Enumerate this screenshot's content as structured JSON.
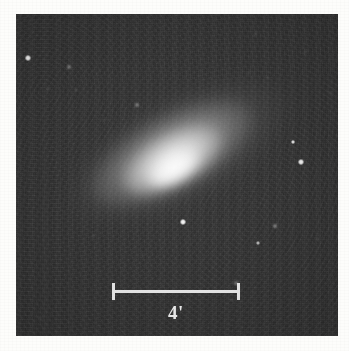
{
  "figure": {
    "type": "astronomical-photograph",
    "background_color": "#2b2b2b",
    "page_color": "#fdfdfb",
    "plate": {
      "x": 16,
      "y": 14,
      "width": 322,
      "height": 322
    }
  },
  "scalebar": {
    "label": "4'",
    "unit": "arcminutes",
    "value": 4,
    "color": "#e6e6e6",
    "x": 112,
    "y": 283,
    "length_px": 128
  },
  "galaxy": {
    "name": "galaxy",
    "center_x": 172,
    "center_y": 175,
    "position_angle_deg": -28,
    "major_axis_px": 150,
    "minor_axis_px": 65,
    "morphology": "lenticular / elliptical, smooth bright bulge with diffuse halo"
  },
  "chart_data": {
    "type": "scatter",
    "title": "",
    "xlabel": "",
    "ylabel": "",
    "stars": [
      {
        "x": 28,
        "y": 58,
        "r": 2.6,
        "brightness": 0.95
      },
      {
        "x": 69,
        "y": 67,
        "r": 1.5,
        "brightness": 0.5
      },
      {
        "x": 48,
        "y": 89,
        "r": 1.3,
        "brightness": 0.4
      },
      {
        "x": 76,
        "y": 90,
        "r": 1.3,
        "brightness": 0.42
      },
      {
        "x": 137,
        "y": 105,
        "r": 1.6,
        "brightness": 0.52
      },
      {
        "x": 104,
        "y": 120,
        "r": 1.2,
        "brightness": 0.34
      },
      {
        "x": 256,
        "y": 34,
        "r": 1.3,
        "brightness": 0.4
      },
      {
        "x": 305,
        "y": 52,
        "r": 1.2,
        "brightness": 0.33
      },
      {
        "x": 249,
        "y": 73,
        "r": 1.2,
        "brightness": 0.32
      },
      {
        "x": 268,
        "y": 78,
        "r": 1.1,
        "brightness": 0.28
      },
      {
        "x": 293,
        "y": 142,
        "r": 2.3,
        "brightness": 0.88
      },
      {
        "x": 301,
        "y": 162,
        "r": 2.8,
        "brightness": 0.96
      },
      {
        "x": 183,
        "y": 222,
        "r": 3.2,
        "brightness": 1.0
      },
      {
        "x": 275,
        "y": 226,
        "r": 1.8,
        "brightness": 0.6
      },
      {
        "x": 258,
        "y": 243,
        "r": 2.0,
        "brightness": 0.66
      },
      {
        "x": 236,
        "y": 283,
        "r": 1.5,
        "brightness": 0.48
      },
      {
        "x": 232,
        "y": 300,
        "r": 1.3,
        "brightness": 0.38
      },
      {
        "x": 93,
        "y": 236,
        "r": 1.2,
        "brightness": 0.3
      },
      {
        "x": 142,
        "y": 255,
        "r": 1.1,
        "brightness": 0.26
      },
      {
        "x": 40,
        "y": 318,
        "r": 1.2,
        "brightness": 0.3
      },
      {
        "x": 318,
        "y": 239,
        "r": 1.2,
        "brightness": 0.3
      },
      {
        "x": 330,
        "y": 93,
        "r": 1.1,
        "brightness": 0.26
      }
    ]
  }
}
